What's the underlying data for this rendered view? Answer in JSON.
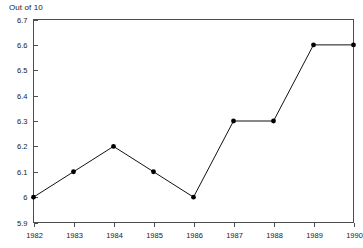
{
  "chart_data": {
    "type": "line",
    "title": "Out of 10",
    "xlabel": "",
    "ylabel": "",
    "categories": [
      "1982",
      "1983",
      "1984",
      "1985",
      "1986",
      "1987",
      "1988",
      "1989",
      "1990"
    ],
    "x": [
      1982,
      1983,
      1984,
      1985,
      1986,
      1987,
      1988,
      1989,
      1990
    ],
    "values": [
      6.0,
      6.1,
      6.2,
      6.1,
      6.0,
      6.3,
      6.3,
      6.6,
      6.6
    ],
    "ylim": [
      5.9,
      6.7
    ],
    "ytick_values": [
      5.9,
      6.0,
      6.1,
      6.2,
      6.3,
      6.4,
      6.5,
      6.6,
      6.7
    ],
    "ytick_labels": [
      "5.9",
      "6",
      "6.1",
      "6.2",
      "6.3",
      "6.4",
      "6.5",
      "6.6",
      "6.7"
    ],
    "xtick_labels": [
      "1982",
      "1983",
      "1984",
      "1985",
      "1986",
      "1987",
      "1988",
      "1989",
      "1990"
    ],
    "grid": false,
    "legend": null,
    "legend_position": "none",
    "marker": "filled-circle",
    "line_color": "#111111",
    "marker_color": "#000000",
    "frame_color": "#4d4d4d",
    "background_color": "#ffffff"
  }
}
